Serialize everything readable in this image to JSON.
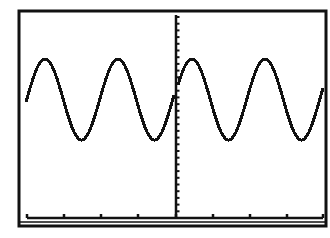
{
  "chart_data": {
    "type": "line",
    "title": "",
    "xlabel": "",
    "ylabel": "",
    "grid": false,
    "legend": null,
    "xlim": [
      -4,
      4
    ],
    "ylim": [
      -8,
      8
    ],
    "x_ticks": [
      -4,
      -3,
      -2,
      -1,
      0,
      1,
      2,
      3,
      4
    ],
    "y_tick_count": 31,
    "series": [
      {
        "name": "left branch (x<0)",
        "x": [
          -4.0,
          -3.5,
          -3.0,
          -2.5,
          -2.0,
          -1.5,
          -1.0,
          -0.5,
          0.0
        ],
        "y": [
          1.0,
          3.4,
          1.0,
          -3.4,
          1.0,
          3.4,
          1.0,
          -3.4,
          0.8
        ]
      },
      {
        "name": "right branch (x>0)",
        "x": [
          0.0,
          0.4,
          1.0,
          1.5,
          2.0,
          2.4,
          3.0,
          3.5,
          4.0
        ],
        "y": [
          2.5,
          3.4,
          1.0,
          -3.4,
          1.0,
          3.4,
          1.0,
          -3.4,
          1.0
        ]
      }
    ],
    "key_points_px": {
      "peaks": [
        [
          45,
          59
        ],
        [
          118,
          59
        ],
        [
          192,
          59
        ],
        [
          265,
          60
        ]
      ],
      "troughs": [
        [
          81,
          140
        ],
        [
          155,
          140
        ],
        [
          230,
          140
        ],
        [
          304,
          140
        ]
      ],
      "left_start": [
        26,
        103
      ],
      "left_end_at_axis": [
        174,
        108
      ],
      "right_start_at_axis": [
        178,
        80
      ],
      "right_end": [
        323,
        103
      ]
    }
  },
  "screen": {
    "border_outer": {
      "x": 18,
      "y": 10,
      "w": 309,
      "h": 217
    },
    "axis_x_px": 176,
    "axis_y_px": 218,
    "x_tick_px": [
      27,
      64,
      101,
      138,
      176,
      213,
      250,
      287,
      323
    ],
    "y_tick_spacing_px": 6.7,
    "ink_color": "#111111",
    "background_color": "#ffffff"
  }
}
